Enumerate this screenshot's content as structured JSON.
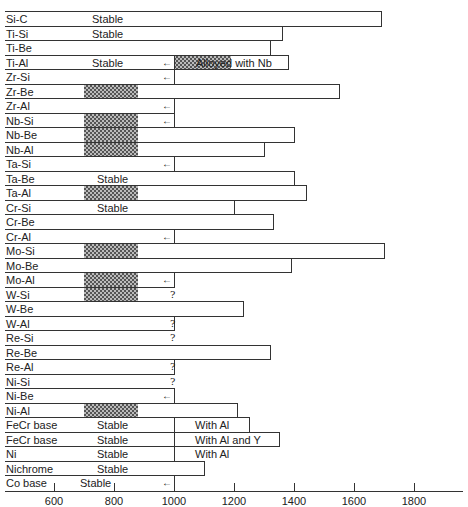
{
  "chart_data": {
    "type": "bar",
    "orientation": "horizontal",
    "title": "",
    "xlabel": "",
    "ylabel": "",
    "xlim": [
      450,
      1950
    ],
    "x_ticks": [
      600,
      800,
      1000,
      1200,
      1400,
      1600,
      1800
    ],
    "x_tick_labels": [
      "600",
      "800",
      "1000",
      "1200",
      "1400",
      "1600",
      "1800"
    ],
    "grid": false,
    "legend": null,
    "categories": [
      "Si-C",
      "Ti-Si",
      "Ti-Be",
      "Ti-Al",
      "Zr-Si",
      "Zr-Be",
      "Zr-Al",
      "Nb-Si",
      "Nb-Be",
      "Nb-Al",
      "Ta-Si",
      "Ta-Be",
      "Ta-Al",
      "Cr-Si",
      "Cr-Be",
      "Cr-Al",
      "Mo-Si",
      "Mo-Be",
      "Mo-Al",
      "W-Si",
      "W-Be",
      "W-Al",
      "Re-Si",
      "Re-Be",
      "Re-Al",
      "Ni-Si",
      "Ni-Be",
      "Ni-Al",
      "FeCr base",
      "FeCr base",
      "Ni",
      "Nichrome",
      "Co base"
    ],
    "rows": [
      {
        "label": "Si-C",
        "start": 450,
        "end": 1690,
        "note": "Stable",
        "hatch": null,
        "arrow": false,
        "question": false
      },
      {
        "label": "Ti-Si",
        "start": 450,
        "end": 1360,
        "note": "Stable",
        "hatch": null,
        "arrow": false,
        "question": false
      },
      {
        "label": "Ti-Be",
        "start": 450,
        "end": 1320,
        "note": "",
        "hatch": null,
        "arrow": false,
        "question": false
      },
      {
        "label": "Ti-Al",
        "start": 1000,
        "end": 1380,
        "note": "Stable",
        "hatch": [
          1000,
          1190
        ],
        "arrow": true,
        "question": false,
        "bar_note": "Alloyed with Nb"
      },
      {
        "label": "Zr-Si",
        "start": 1000,
        "end": null,
        "note": "",
        "hatch": null,
        "arrow": true,
        "question": false
      },
      {
        "label": "Zr-Be",
        "start": 450,
        "end": 1550,
        "note": "",
        "hatch": [
          700,
          880
        ],
        "arrow": false,
        "question": false
      },
      {
        "label": "Zr-Al",
        "start": 1000,
        "end": null,
        "note": "",
        "hatch": null,
        "arrow": true,
        "question": false
      },
      {
        "label": "Nb-Si",
        "start": 1000,
        "end": null,
        "note": "",
        "hatch": [
          700,
          880
        ],
        "arrow": true,
        "question": false
      },
      {
        "label": "Nb-Be",
        "start": 450,
        "end": 1400,
        "note": "",
        "hatch": [
          700,
          880
        ],
        "arrow": false,
        "question": false
      },
      {
        "label": "Nb-Al",
        "start": 450,
        "end": 1300,
        "note": "",
        "hatch": [
          700,
          880
        ],
        "arrow": false,
        "question": false
      },
      {
        "label": "Ta-Si",
        "start": 1000,
        "end": null,
        "note": "",
        "hatch": null,
        "arrow": true,
        "question": false
      },
      {
        "label": "Ta-Be",
        "start": 450,
        "end": 1400,
        "note": "Stable",
        "hatch": null,
        "arrow": false,
        "question": false
      },
      {
        "label": "Ta-Al",
        "start": 450,
        "end": 1440,
        "note": "",
        "hatch": [
          700,
          880
        ],
        "arrow": false,
        "question": false
      },
      {
        "label": "Cr-Si",
        "start": 450,
        "end": 1200,
        "note": "Stable",
        "hatch": null,
        "arrow": false,
        "question": false
      },
      {
        "label": "Cr-Be",
        "start": 450,
        "end": 1330,
        "note": "",
        "hatch": null,
        "arrow": false,
        "question": false
      },
      {
        "label": "Cr-Al",
        "start": 1000,
        "end": null,
        "note": "",
        "hatch": null,
        "arrow": true,
        "question": false
      },
      {
        "label": "Mo-Si",
        "start": 450,
        "end": 1700,
        "note": "",
        "hatch": [
          700,
          880
        ],
        "arrow": false,
        "question": false
      },
      {
        "label": "Mo-Be",
        "start": 450,
        "end": 1390,
        "note": "",
        "hatch": null,
        "arrow": false,
        "question": false
      },
      {
        "label": "Mo-Al",
        "start": 1000,
        "end": null,
        "note": "",
        "hatch": [
          700,
          880
        ],
        "arrow": true,
        "question": false
      },
      {
        "label": "W-Si",
        "start": 450,
        "end": null,
        "note": "",
        "hatch": [
          700,
          880
        ],
        "arrow": false,
        "question": true
      },
      {
        "label": "W-Be",
        "start": 450,
        "end": 1230,
        "note": "",
        "hatch": null,
        "arrow": false,
        "question": false
      },
      {
        "label": "W-Al",
        "start": 450,
        "end": 1000,
        "note": "",
        "hatch": null,
        "arrow": false,
        "question": true
      },
      {
        "label": "Re-Si",
        "start": 450,
        "end": null,
        "note": "",
        "hatch": null,
        "arrow": false,
        "question": true
      },
      {
        "label": "Re-Be",
        "start": 450,
        "end": 1320,
        "note": "",
        "hatch": null,
        "arrow": false,
        "question": false
      },
      {
        "label": "Re-Al",
        "start": 450,
        "end": 1000,
        "note": "",
        "hatch": null,
        "arrow": false,
        "question": true
      },
      {
        "label": "Ni-Si",
        "start": 450,
        "end": null,
        "note": "",
        "hatch": null,
        "arrow": false,
        "question": true
      },
      {
        "label": "Ni-Be",
        "start": 1000,
        "end": null,
        "note": "",
        "hatch": null,
        "arrow": true,
        "question": false
      },
      {
        "label": "Ni-Al",
        "start": 450,
        "end": 1210,
        "note": "",
        "hatch": [
          700,
          880
        ],
        "arrow": false,
        "question": false
      },
      {
        "label": "FeCr base",
        "start": 1000,
        "end": 1250,
        "note": "Stable",
        "hatch": null,
        "arrow": false,
        "question": false,
        "bar_note": "With Al"
      },
      {
        "label": "FeCr base",
        "start": 1000,
        "end": 1350,
        "note": "Stable",
        "hatch": null,
        "arrow": false,
        "question": false,
        "bar_note": "With Al and Y"
      },
      {
        "label": "Ni",
        "start": 1000,
        "end": null,
        "note": "Stable",
        "hatch": null,
        "arrow": false,
        "question": false,
        "bar_note": "With Al"
      },
      {
        "label": "Nichrome",
        "start": 450,
        "end": 1100,
        "note": "Stable",
        "hatch": null,
        "arrow": false,
        "question": false
      },
      {
        "label": "Co base",
        "start": 1000,
        "end": null,
        "note": "Stable",
        "hatch": null,
        "arrow": true,
        "question": false
      }
    ],
    "annotations": [
      "Stable",
      "Alloyed with Nb",
      "With Al",
      "With Al and Y",
      "?",
      "←"
    ]
  }
}
